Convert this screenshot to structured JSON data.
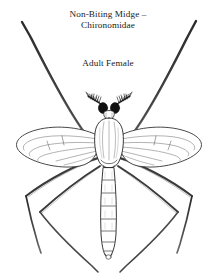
{
  "page": {
    "background_color": "#ffffff",
    "ink_color": "#1a1a1a",
    "width": 216,
    "height": 280
  },
  "labels": {
    "title": "Non-Biting Midge –\nChironomidae",
    "title_line_1": "Non-Biting Midge –",
    "title_line_2": "Chironomidae",
    "subtitle": "Adult Female"
  },
  "figure": {
    "name": "chironomid-midge-dorsal-illustration",
    "view": "dorsal",
    "style": "black-and-white scientific line drawing",
    "parts": [
      "head",
      "plumose-antennae",
      "thorax",
      "left-wing",
      "right-wing",
      "abdomen",
      "legs"
    ],
    "abdomen_segment_count": 7,
    "leg_count": 6,
    "wing_count": 2,
    "antenna_count": 2
  }
}
